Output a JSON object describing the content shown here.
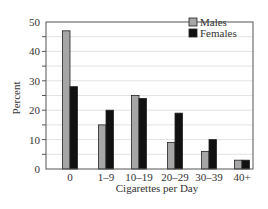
{
  "chart_data": {
    "type": "bar",
    "title": "",
    "xlabel": "Cigarettes per Day",
    "ylabel": "Percent",
    "categories": [
      "0",
      "1–9",
      "10–19",
      "20–29",
      "30–39",
      "40+"
    ],
    "series": [
      {
        "name": "Males",
        "color": "#a6a6a6",
        "values": [
          47,
          15,
          25,
          9,
          6,
          3
        ]
      },
      {
        "name": "Females",
        "color": "#111111",
        "values": [
          28,
          20,
          24,
          19,
          10,
          3
        ]
      }
    ],
    "ylim": [
      0,
      50
    ],
    "yticks": [
      0,
      10,
      20,
      30,
      40,
      50
    ],
    "minor_tick_step": 5,
    "grid": true,
    "legend_position": "upper right"
  }
}
